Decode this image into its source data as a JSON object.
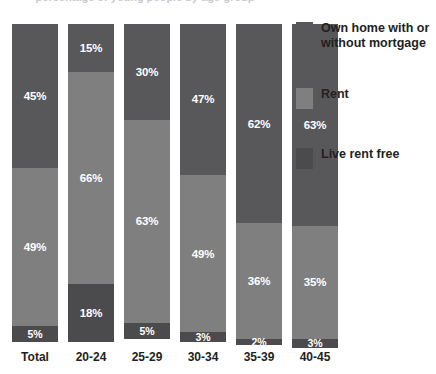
{
  "chart_data": {
    "type": "bar",
    "subtype": "stacked-bar-100",
    "title": "",
    "xlabel": "",
    "ylabel": "",
    "ylim": [
      0,
      100
    ],
    "grid": false,
    "legend_position": "right",
    "units": "%",
    "categories": [
      "Total",
      "20-24",
      "25-29",
      "30-34",
      "35-39",
      "40-45"
    ],
    "series": [
      {
        "name": "Own home with or without mortgage",
        "color": "#58585a",
        "values": [
          45,
          15,
          30,
          47,
          62,
          63
        ],
        "labels": [
          "45%",
          "15%",
          "30%",
          "47%",
          "62%",
          "63%"
        ]
      },
      {
        "name": "Rent",
        "color": "#7f7f80",
        "values": [
          49,
          66,
          63,
          49,
          36,
          35
        ],
        "labels": [
          "49%",
          "66%",
          "63%",
          "49%",
          "36%",
          "35%"
        ]
      },
      {
        "name": "Live rent free",
        "color": "#4b4b4d",
        "values": [
          5,
          18,
          5,
          3,
          2,
          3
        ],
        "labels": [
          "5%",
          "18%",
          "5%",
          "3%",
          "2%",
          "3%"
        ]
      }
    ]
  },
  "title_remnant": "percentage of young people by age group",
  "legend": {
    "items": [
      {
        "label": "Own home with or without mortgage",
        "color": "#58585a",
        "top": 0
      },
      {
        "label": "Rent",
        "color": "#7f7f80",
        "top": 66
      },
      {
        "label": "Live rent free",
        "color": "#4b4b4d",
        "top": 126
      }
    ]
  },
  "colors": {
    "own": "#58585a",
    "rent": "#7f7f80",
    "free": "#4b4b4d",
    "text": "#231f20",
    "label_text": "#ffffff",
    "background": "#ffffff"
  }
}
